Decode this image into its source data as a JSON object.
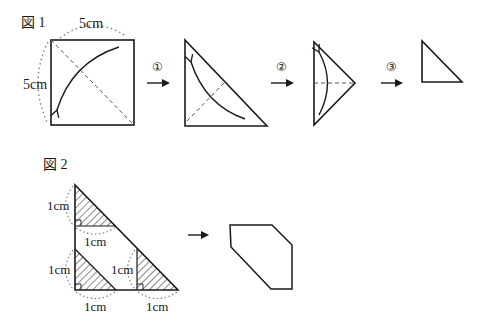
{
  "figure1": {
    "title": "図 1",
    "side_top_label": "5cm",
    "side_left_label": "5cm",
    "steps": [
      {
        "number": "①"
      },
      {
        "number": "②"
      },
      {
        "number": "③"
      }
    ]
  },
  "figure2": {
    "title": "図 2",
    "labels": {
      "top_vertical": "1cm",
      "top_horizontal": "1cm",
      "bottom_left_vertical": "1cm",
      "bottom_left_horizontal": "1cm",
      "bottom_right_vertical": "1cm",
      "bottom_right_horizontal": "1cm"
    }
  },
  "colors": {
    "stroke": "#1a1a1a",
    "dashed": "#555555",
    "dotted": "#777777"
  }
}
